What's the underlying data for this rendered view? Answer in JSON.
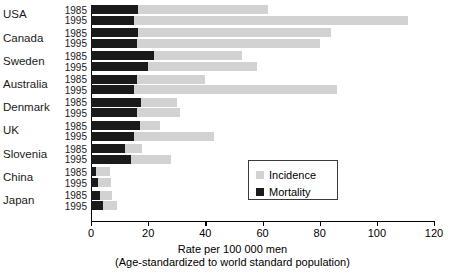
{
  "chart_data": {
    "type": "bar",
    "orientation": "horizontal",
    "title": "",
    "xlabel": "Rate per 100 000 men",
    "xlabel_sub": "(Age-standardized to world standard population)",
    "ylabel": "",
    "xlim": [
      0,
      120
    ],
    "xticks": [
      0,
      20,
      40,
      60,
      80,
      100,
      120
    ],
    "xticklabels": [
      "0",
      "20",
      "40",
      "60",
      "80",
      "100",
      "120"
    ],
    "grid": false,
    "legend_position": "center-right",
    "series": [
      {
        "name": "Incidence",
        "color": "#d2d2d2"
      },
      {
        "name": "Mortality",
        "color": "#1a1a1a"
      }
    ],
    "categories": [
      "USA",
      "Canada",
      "Sweden",
      "Australia",
      "Denmark",
      "UK",
      "Slovenia",
      "China",
      "Japan"
    ],
    "years": [
      "1985",
      "1995"
    ],
    "groups": [
      {
        "country": "USA",
        "rows": [
          {
            "year": "1985",
            "incidence": 62,
            "mortality": 16.5
          },
          {
            "year": "1995",
            "incidence": 111,
            "mortality": 15.0
          }
        ]
      },
      {
        "country": "Canada",
        "rows": [
          {
            "year": "1985",
            "incidence": 84,
            "mortality": 16.5
          },
          {
            "year": "1995",
            "incidence": 80,
            "mortality": 16.0
          }
        ]
      },
      {
        "country": "Sweden",
        "rows": [
          {
            "year": "1985",
            "incidence": 53,
            "mortality": 22.0
          },
          {
            "year": "1995",
            "incidence": 58,
            "mortality": 20.0
          }
        ]
      },
      {
        "country": "Australia",
        "rows": [
          {
            "year": "1985",
            "incidence": 40,
            "mortality": 16.0
          },
          {
            "year": "1995",
            "incidence": 86,
            "mortality": 15.0
          }
        ]
      },
      {
        "country": "Denmark",
        "rows": [
          {
            "year": "1985",
            "incidence": 30,
            "mortality": 17.5
          },
          {
            "year": "1995",
            "incidence": 31,
            "mortality": 16.0
          }
        ]
      },
      {
        "country": "UK",
        "rows": [
          {
            "year": "1985",
            "incidence": 24,
            "mortality": 17.0
          },
          {
            "year": "1995",
            "incidence": 43,
            "mortality": 15.0
          }
        ]
      },
      {
        "country": "Slovenia",
        "rows": [
          {
            "year": "1985",
            "incidence": 18,
            "mortality": 12.0
          },
          {
            "year": "1995",
            "incidence": 28,
            "mortality": 14.0
          }
        ]
      },
      {
        "country": "China",
        "rows": [
          {
            "year": "1985",
            "incidence": 6.5,
            "mortality": 1.8
          },
          {
            "year": "1995",
            "incidence": 7.0,
            "mortality": 2.5
          }
        ]
      },
      {
        "country": "Japan",
        "rows": [
          {
            "year": "1985",
            "incidence": 7.5,
            "mortality": 3.2
          },
          {
            "year": "1995",
            "incidence": 9.0,
            "mortality": 4.2
          }
        ]
      }
    ]
  },
  "legend": {
    "items": [
      {
        "label": "Incidence",
        "color": "#d2d2d2"
      },
      {
        "label": "Mortality",
        "color": "#1a1a1a"
      }
    ]
  }
}
